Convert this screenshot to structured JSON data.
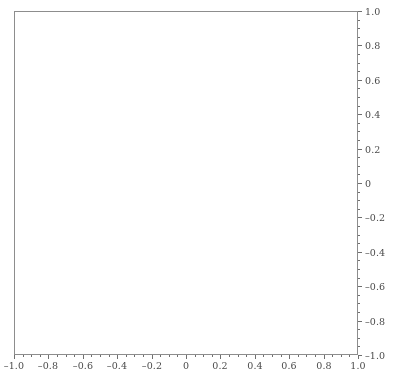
{
  "figure": {
    "width": 394,
    "height": 381,
    "background_color": "#ffffff",
    "frame_color": "#8d8d8d",
    "tick_color": "#6f6f6f",
    "label_color": "#4a4a4a"
  },
  "chart_data": {
    "type": "scatter",
    "title": "",
    "xlabel": "",
    "ylabel": "",
    "xlim": [
      -1.0,
      1.0
    ],
    "ylim": [
      -1.0,
      1.0
    ],
    "grid": false,
    "legend": null,
    "frame": true,
    "aspect_ratio": "equal",
    "marker": {
      "shape": "point",
      "size_px": 1,
      "color": "#9a9a9a",
      "edge_color": "#6b6b6b"
    },
    "point_count": 6000,
    "distribution": {
      "region": "unit-disk",
      "radius": 1.0,
      "center": [
        0,
        0
      ],
      "boundary_concentration": true
    },
    "xticks": [
      -1.0,
      -0.8,
      -0.6,
      -0.4,
      -0.2,
      0,
      0.2,
      0.4,
      0.6,
      0.8,
      1.0
    ],
    "xticklabels": [
      "–1.0",
      "–0.8",
      "–0.6",
      "–0.4",
      "–0.2",
      "0",
      "0.2",
      "0.4",
      "0.6",
      "0.8",
      "1.0"
    ],
    "yticks": [
      -1.0,
      -0.8,
      -0.6,
      -0.4,
      -0.2,
      0,
      0.2,
      0.4,
      0.6,
      0.8,
      1.0
    ],
    "yticklabels": [
      "–1.0",
      "–0.8",
      "–0.6",
      "–0.4",
      "–0.2",
      "0",
      "0.2",
      "0.4",
      "0.6",
      "0.8",
      "1.0"
    ],
    "xtick_side": "bottom",
    "ytick_side": "right",
    "tick_direction": "out",
    "minor_ticks_per_interval": 3
  }
}
